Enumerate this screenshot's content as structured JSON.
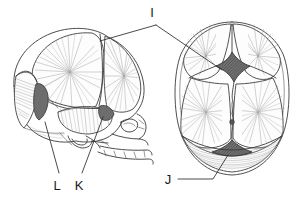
{
  "figure": {
    "background_color": "#ffffff",
    "ink_color": "#3a3a3a",
    "fontanelle_fill_color": "#6a6a6a",
    "views": [
      {
        "id": "lateral",
        "name": "lateral-view",
        "description": "Lateral (side) view of neonatal skull facing right"
      },
      {
        "id": "superior",
        "name": "superior-view",
        "description": "Superior (top) view of neonatal skull"
      }
    ],
    "labels": [
      {
        "id": "I",
        "text": "I",
        "name": "label-i",
        "x": 156,
        "y": 16,
        "target": "anterior-fontanelle"
      },
      {
        "id": "J",
        "text": "J",
        "name": "label-j",
        "x": 168,
        "y": 183,
        "target": "posterior-fontanelle"
      },
      {
        "id": "K",
        "text": "K",
        "name": "label-k",
        "x": 77,
        "y": 189,
        "target": "sphenoid-fontanelle"
      },
      {
        "id": "L",
        "text": "L",
        "name": "label-l",
        "x": 55,
        "y": 189,
        "target": "mastoid-fontanelle"
      }
    ]
  }
}
